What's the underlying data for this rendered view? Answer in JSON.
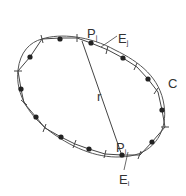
{
  "diagram": {
    "labels": {
      "curve": "C",
      "radius": "r",
      "point_j": "P",
      "point_j_sub": "j",
      "edge_j": "E",
      "edge_j_sub": "j",
      "point_i": "P",
      "point_i_sub": "i",
      "edge_i": "E",
      "edge_i_sub": "i"
    },
    "colors": {
      "stroke": "#444444",
      "dot": "#222222"
    }
  }
}
